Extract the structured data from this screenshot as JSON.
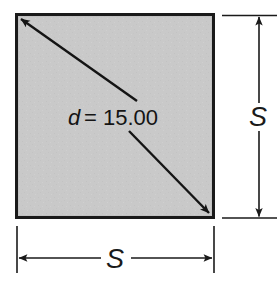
{
  "figure": {
    "type": "geometry-diagram",
    "shape": "square",
    "title": "",
    "background_color": "#ffffff",
    "square": {
      "fill_color": "#c9c9c9",
      "stroke_color": "#1a1a1a",
      "x": 16,
      "y": 14,
      "width": 198,
      "height": 204
    },
    "diagonal": {
      "label_variable": "d",
      "label_equals": "=",
      "label_value": "15.00",
      "label_full": "d = 15.00",
      "arrow_style": "double-headed",
      "color": "#141414"
    },
    "dimensions": [
      {
        "name": "height",
        "label": "S",
        "orientation": "vertical",
        "position": "right",
        "arrow_style": "double-headed",
        "color": "#1a1a1a"
      },
      {
        "name": "width",
        "label": "S",
        "orientation": "horizontal",
        "position": "bottom",
        "arrow_style": "double-headed",
        "color": "#1a1a1a"
      }
    ]
  }
}
